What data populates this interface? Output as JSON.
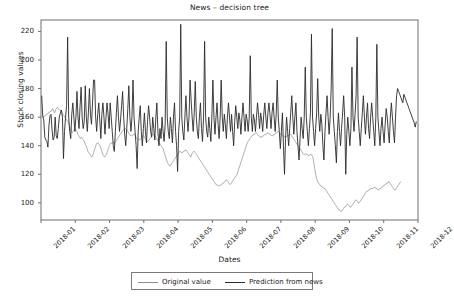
{
  "chart_data": {
    "type": "line",
    "title": "News – decision tree",
    "xlabel": "Dates",
    "ylabel": "Stock closing values",
    "grid": false,
    "legend_position": "bottom-center",
    "ylim": [
      88,
      228
    ],
    "yticks": [
      100,
      120,
      140,
      160,
      180,
      200,
      220
    ],
    "ytick_labels": [
      "100",
      "120",
      "140",
      "160",
      "180",
      "200",
      "220"
    ],
    "xlim": [
      "2018-01",
      "2018-12"
    ],
    "xticks": [
      "2018-01",
      "2018-02",
      "2018-03",
      "2018-04",
      "2018-05",
      "2018-06",
      "2018-07",
      "2018-08",
      "2018-09",
      "2018-10",
      "2018-11",
      "2018-12"
    ],
    "xtick_labels": [
      "2018-01",
      "2018-02",
      "2018-03",
      "2018-04",
      "2018-05",
      "2018-06",
      "2018-07",
      "2018-08",
      "2018-09",
      "2018-10",
      "2018-11",
      "2018-12"
    ],
    "series": [
      {
        "name": "Original value",
        "color": "#8e8e8e",
        "line_width": 0.7,
        "x_start_month": 0.02,
        "x_end_month": 10.5,
        "values": [
          161,
          160,
          160,
          161,
          161,
          162,
          162,
          163,
          163,
          164,
          164,
          165,
          166,
          164,
          163,
          165,
          166,
          167,
          166,
          165,
          165,
          164,
          163,
          162,
          161,
          160,
          159,
          158,
          157,
          156,
          154,
          152,
          150,
          149,
          150,
          151,
          152,
          151,
          150,
          148,
          147,
          146,
          145,
          146,
          145,
          144,
          143,
          141,
          140,
          138,
          136,
          135,
          134,
          133,
          132,
          133,
          135,
          137,
          139,
          141,
          142,
          142,
          141,
          140,
          138,
          136,
          134,
          133,
          132,
          133,
          134,
          136,
          138,
          140,
          141,
          142,
          142,
          142,
          142,
          142,
          143,
          144,
          145,
          146,
          147,
          148,
          149,
          150,
          151,
          151,
          152,
          152,
          151,
          150,
          149,
          148,
          147,
          147,
          147,
          148,
          148,
          147,
          146,
          145,
          144,
          144,
          144,
          145,
          146,
          147,
          147,
          146,
          145,
          144,
          143,
          143,
          144,
          145,
          146,
          147,
          148,
          148,
          147,
          146,
          145,
          144,
          143,
          142,
          141,
          140,
          139,
          138,
          136,
          134,
          132,
          130,
          128,
          127,
          126,
          126,
          127,
          128,
          129,
          130,
          131,
          132,
          133,
          134,
          135,
          136,
          136,
          135,
          135,
          136,
          136,
          137,
          137,
          136,
          135,
          134,
          133,
          132,
          134,
          135,
          136,
          136,
          135,
          134,
          133,
          132,
          131,
          130,
          129,
          128,
          127,
          126,
          125,
          124,
          123,
          122,
          121,
          120,
          119,
          118,
          117,
          116,
          115,
          114,
          113,
          113,
          112,
          112,
          112,
          112,
          113,
          113,
          114,
          114,
          115,
          116,
          116,
          115,
          114,
          113,
          113,
          114,
          115,
          116,
          117,
          118,
          119,
          120,
          122,
          124,
          126,
          128,
          130,
          132,
          134,
          136,
          138,
          140,
          142,
          143,
          144,
          145,
          146,
          147,
          147,
          148,
          148,
          149,
          149,
          148,
          147,
          147,
          146,
          146,
          146,
          147,
          147,
          148,
          148,
          148,
          149,
          149,
          148,
          148,
          147,
          147,
          147,
          148,
          148,
          149,
          149,
          150,
          150,
          149,
          148,
          148,
          147,
          147,
          146,
          146,
          146,
          147,
          147,
          147,
          148,
          148,
          147,
          146,
          145,
          144,
          143,
          142,
          141,
          140,
          139,
          138,
          137,
          136,
          135,
          134,
          134,
          134,
          134,
          134,
          133,
          133,
          134,
          134,
          133,
          132,
          128,
          124,
          120,
          117,
          115,
          114,
          113,
          112,
          112,
          111,
          111,
          110,
          110,
          109,
          108,
          107,
          106,
          105,
          104,
          103,
          102,
          101,
          100,
          99,
          98,
          97,
          96,
          95,
          95,
          94,
          94,
          95,
          96,
          97,
          97,
          98,
          99,
          99,
          98,
          97,
          97,
          98,
          99,
          100,
          101,
          102,
          102,
          101,
          100,
          100,
          101,
          102,
          103,
          104,
          105,
          106,
          107,
          108,
          108,
          109,
          109,
          110,
          110,
          110,
          110,
          111,
          111,
          110,
          110,
          109,
          109,
          110,
          110,
          111,
          111,
          112,
          112,
          113,
          113,
          114,
          114,
          115,
          114,
          113,
          112,
          111,
          110,
          109,
          109,
          110,
          111,
          112,
          113,
          114,
          115
        ]
      },
      {
        "name": "Prediction from news",
        "color": "#2a2a2a",
        "line_width": 0.9,
        "x_start_month": 0.02,
        "x_end_month": 10.95,
        "values": [
          175,
          161,
          158,
          146,
          144,
          143,
          139,
          154,
          161,
          162,
          151,
          144,
          146,
          160,
          147,
          145,
          152,
          160,
          163,
          165,
          160,
          131,
          150,
          160,
          168,
          216,
          160,
          150,
          145,
          162,
          170,
          160,
          150,
          160,
          178,
          160,
          152,
          168,
          181,
          160,
          152,
          157,
          182,
          160,
          150,
          163,
          180,
          162,
          155,
          170,
          186,
          186,
          160,
          150,
          162,
          170,
          158,
          145,
          162,
          170,
          160,
          148,
          160,
          170,
          162,
          152,
          170,
          160,
          150,
          140,
          136,
          150,
          163,
          175,
          160,
          150,
          158,
          168,
          178,
          160,
          148,
          140,
          152,
          166,
          182,
          160,
          150,
          160,
          186,
          160,
          150,
          140,
          124,
          150,
          160,
          168,
          150,
          140,
          152,
          163,
          150,
          142,
          157,
          168,
          160,
          150,
          146,
          160,
          152,
          144,
          160,
          170,
          150,
          140,
          152,
          145,
          160,
          150,
          143,
          155,
          213,
          160,
          150,
          145,
          160,
          152,
          142,
          160,
          170,
          150,
          140,
          122,
          150,
          160,
          225,
          160,
          150,
          144,
          160,
          175,
          160,
          150,
          160,
          186,
          172,
          160,
          150,
          163,
          185,
          160,
          150,
          145,
          160,
          170,
          152,
          143,
          160,
          213,
          160,
          150,
          146,
          160,
          152,
          143,
          160,
          186,
          160,
          148,
          160,
          170,
          155,
          145,
          160,
          186,
          160,
          150,
          162,
          155,
          145,
          160,
          170,
          160,
          150,
          162,
          150,
          140,
          157,
          168,
          160,
          152,
          163,
          158,
          148,
          160,
          170,
          160,
          150,
          162,
          158,
          150,
          160,
          203,
          160,
          150,
          162,
          158,
          150,
          160,
          170,
          162,
          152,
          163,
          158,
          150,
          162,
          170,
          160,
          152,
          163,
          170,
          162,
          152,
          163,
          170,
          160,
          150,
          162,
          186,
          160,
          150,
          138,
          150,
          163,
          140,
          120,
          145,
          160,
          150,
          140,
          152,
          163,
          175,
          160,
          148,
          160,
          170,
          150,
          140,
          130,
          145,
          160,
          152,
          145,
          160,
          195,
          160,
          150,
          140,
          152,
          163,
          218,
          160,
          150,
          140,
          152,
          163,
          187,
          160,
          150,
          162,
          155,
          140,
          130,
          150,
          163,
          175,
          160,
          148,
          160,
          181,
          222,
          160,
          150,
          140,
          128,
          150,
          163,
          150,
          140,
          152,
          163,
          175,
          160,
          120,
          148,
          160,
          150,
          140,
          152,
          195,
          160,
          150,
          162,
          175,
          216,
          160,
          150,
          140,
          152,
          163,
          175,
          160,
          148,
          160,
          170,
          152,
          145,
          160,
          170,
          160,
          150,
          140,
          160,
          211,
          160,
          150,
          140,
          152,
          160,
          150,
          142,
          155,
          166,
          160,
          150,
          142,
          160,
          170,
          160,
          150,
          142,
          160,
          175,
          180,
          178,
          176,
          174,
          172,
          170,
          176,
          174,
          172,
          170,
          168,
          166,
          164,
          162,
          160,
          158,
          156,
          153,
          157
        ]
      }
    ]
  },
  "axes": {
    "title": "News – decision tree",
    "xlabel": "Dates",
    "ylabel": "Stock closing values"
  },
  "legend": {
    "entries": [
      {
        "label": "Original value",
        "style": "orig"
      },
      {
        "label": "Prediction from news",
        "style": "pred"
      }
    ]
  }
}
